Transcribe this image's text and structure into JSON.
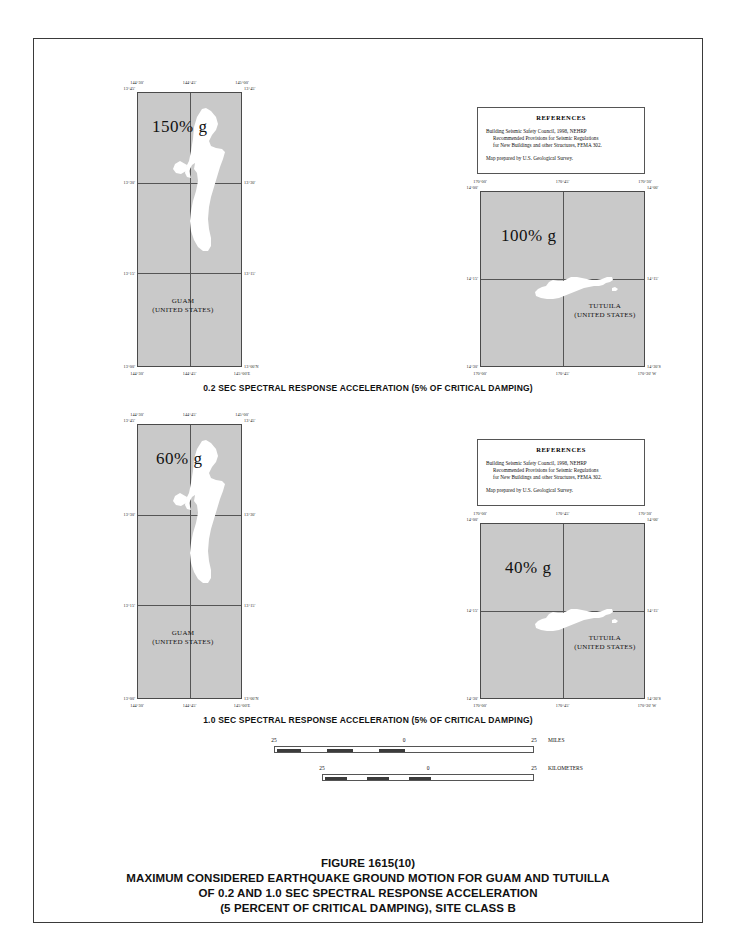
{
  "figure": {
    "title_lines": [
      "FIGURE 1615(10)",
      "MAXIMUM CONSIDERED EARTHQUAKE GROUND MOTION FOR GUAM AND TUTUILLA",
      "OF 0.2 AND 1.0 SEC SPECTRAL RESPONSE ACCELERATION",
      "(5 PERCENT OF CRITICAL DAMPING), SITE CLASS B"
    ]
  },
  "sections": [
    {
      "caption": "0.2 SEC SPECTRAL RESPONSE ACCELERATION (5% OF CRITICAL DAMPING)"
    },
    {
      "caption": "1.0 SEC SPECTRAL RESPONSE ACCELERATION (5% OF CRITICAL DAMPING)"
    }
  ],
  "references": {
    "heading": "REFERENCES",
    "line1": "Building Seismic Safety Council, 1998, NEHRP",
    "line2": "Recommended Provisions for Seismic Regulations",
    "line3": "for New Buildings and other Structures, FEMA 302.",
    "line4": "Map prepared by U.S. Geological Survey."
  },
  "maps": {
    "guam_02": {
      "value": "150% g",
      "place_name": "GUAM",
      "place_country": "(UNITED STATES)",
      "top_left": "144°30'",
      "top_center": "144°45'",
      "top_right": "145°00'",
      "left_top": "13°45'",
      "right_top": "13°45'",
      "left_mid": "13°30'",
      "right_mid": "13°30'",
      "left_low": "13°15'",
      "right_low": "13°15'",
      "left_bottom": "13°00'",
      "right_bottom": "13°00'N",
      "bottom_left": "144°30'",
      "bottom_center": "144°45'",
      "bottom_right": "145°00'E"
    },
    "tutuila_02": {
      "value": "100% g",
      "place_name": "TUTUILA",
      "place_country": "(UNITED STATES)",
      "top_left": "170°00'",
      "top_center": "170°45'",
      "top_right": "170°30'",
      "left_top": "14°00'",
      "right_top": "14°00'",
      "left_mid": "14°15'",
      "right_mid": "14°15'",
      "left_bottom": "14°30'",
      "right_bottom": "14°30'S",
      "bottom_left": "170°00'",
      "bottom_center": "170°45'",
      "bottom_right": "170°30' W"
    },
    "guam_10": {
      "value": "60% g",
      "place_name": "GUAM",
      "place_country": "(UNITED STATES)",
      "top_left": "144°30'",
      "top_center": "144°45'",
      "top_right": "145°00'",
      "left_top": "13°45'",
      "right_top": "13°45'",
      "left_mid": "13°30'",
      "right_mid": "13°30'",
      "left_low": "13°15'",
      "right_low": "13°15'",
      "left_bottom": "13°00'",
      "right_bottom": "13°00'N",
      "bottom_left": "144°30'",
      "bottom_center": "144°45'",
      "bottom_right": "145°00'E"
    },
    "tutuila_10": {
      "value": "40% g",
      "place_name": "TUTUILA",
      "place_country": "(UNITED STATES)",
      "top_left": "170°00'",
      "top_center": "170°45'",
      "top_right": "170°30'",
      "left_top": "14°00'",
      "right_top": "14°00'",
      "left_mid": "14°15'",
      "right_mid": "14°15'",
      "left_bottom": "14°30'",
      "right_bottom": "14°30'S",
      "bottom_left": "170°00'",
      "bottom_center": "170°45'",
      "bottom_right": "170°30' W"
    }
  },
  "scale": {
    "title": "Scale  1:1,000,000",
    "miles": {
      "left_number": "25",
      "center_number": "0",
      "right_number": "25",
      "unit": "MILES"
    },
    "kilometers": {
      "left_number": "25",
      "center_number": "0",
      "right_number": "25",
      "unit": "KILOMETERS"
    }
  },
  "colors": {
    "map_fill": "#c9c9c9",
    "island_fill": "#ffffff",
    "border": "#4a4a4a"
  }
}
